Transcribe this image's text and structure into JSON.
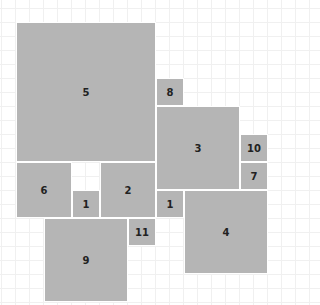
{
  "diagram": {
    "type": "squared-rectangle tiling",
    "grid_unit_px": 14,
    "origin_px": [
      16,
      22
    ],
    "fill_color": "#b5b5b5",
    "squares": [
      {
        "label": "5",
        "x": 0,
        "y": 0,
        "size": 10
      },
      {
        "label": "8",
        "x": 10,
        "y": 4,
        "size": 2
      },
      {
        "label": "3",
        "x": 10,
        "y": 6,
        "size": 6
      },
      {
        "label": "10",
        "x": 16,
        "y": 8,
        "size": 2
      },
      {
        "label": "7",
        "x": 16,
        "y": 10,
        "size": 2
      },
      {
        "label": "6",
        "x": 0,
        "y": 10,
        "size": 4
      },
      {
        "label": "1",
        "x": 4,
        "y": 12,
        "size": 2
      },
      {
        "label": "2",
        "x": 6,
        "y": 10,
        "size": 4
      },
      {
        "label": "1",
        "x": 10,
        "y": 12,
        "size": 2
      },
      {
        "label": "4",
        "x": 12,
        "y": 12,
        "size": 6
      },
      {
        "label": "11",
        "x": 8,
        "y": 14,
        "size": 2
      },
      {
        "label": "9",
        "x": 2,
        "y": 14,
        "size": 6
      }
    ]
  }
}
